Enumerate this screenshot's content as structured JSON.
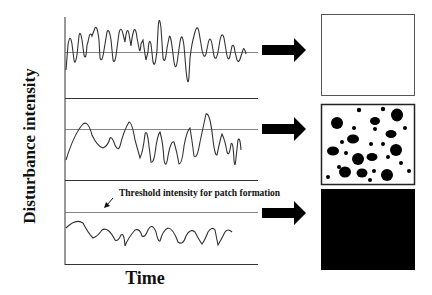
{
  "diagram": {
    "y_axis_label": "Disturbance intensity",
    "x_axis_label": "Time",
    "annotation": "Threshold intensity for patch formation",
    "colors": {
      "ink": "#111111",
      "line": "#444444",
      "background": "#ffffff"
    },
    "rows": [
      {
        "id": "high-frequency-high-intensity",
        "signal": "frequent, high-amplitude fluctuations crossing threshold",
        "outcome": "empty-box",
        "outcome_description": "white box (no patches)"
      },
      {
        "id": "intermediate",
        "signal": "moderate fluctuations occasionally crossing threshold",
        "outcome": "patchy-box",
        "outcome_description": "box with scattered black patches"
      },
      {
        "id": "low-intensity",
        "signal": "low-amplitude fluctuations below threshold",
        "outcome": "solid-box",
        "outcome_description": "solid black box (full cover)"
      }
    ]
  }
}
